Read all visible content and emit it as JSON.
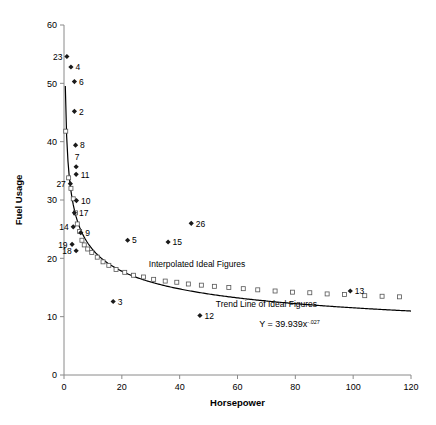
{
  "chart_data": {
    "type": "scatter",
    "title": "",
    "xlabel": "Horsepower",
    "ylabel": "Fuel Usage",
    "xlim": [
      0,
      120
    ],
    "ylim": [
      0,
      60
    ],
    "xticks": [
      0,
      20,
      40,
      60,
      80,
      100,
      120
    ],
    "yticks": [
      0,
      10,
      20,
      30,
      40,
      50,
      60
    ],
    "grid": false,
    "legend_position": "none",
    "series": [
      {
        "name": "Actual Figures",
        "marker": "diamond",
        "points": [
          {
            "label": "23",
            "x": 1.0,
            "y": 54.6
          },
          {
            "label": "4",
            "x": 2.4,
            "y": 52.8
          },
          {
            "label": "6",
            "x": 3.6,
            "y": 50.3
          },
          {
            "label": "2",
            "x": 3.6,
            "y": 45.2
          },
          {
            "label": "8",
            "x": 4.0,
            "y": 39.4
          },
          {
            "label": "7",
            "x": 4.2,
            "y": 35.7
          },
          {
            "label": "11",
            "x": 4.2,
            "y": 34.4
          },
          {
            "label": "27",
            "x": 2.2,
            "y": 32.8
          },
          {
            "label": "10",
            "x": 4.3,
            "y": 29.9
          },
          {
            "label": "17",
            "x": 3.6,
            "y": 27.8
          },
          {
            "label": "14",
            "x": 3.2,
            "y": 25.4
          },
          {
            "label": "9",
            "x": 5.8,
            "y": 24.4
          },
          {
            "label": "19",
            "x": 2.8,
            "y": 22.4
          },
          {
            "label": "18",
            "x": 4.2,
            "y": 21.3
          },
          {
            "label": "5",
            "x": 22.0,
            "y": 23.1
          },
          {
            "label": "15",
            "x": 36.0,
            "y": 22.8
          },
          {
            "label": "26",
            "x": 44.0,
            "y": 26.0
          },
          {
            "label": "3",
            "x": 17.0,
            "y": 12.6
          },
          {
            "label": "12",
            "x": 47.0,
            "y": 10.2
          },
          {
            "label": "13",
            "x": 99.0,
            "y": 14.4
          }
        ]
      },
      {
        "name": "Interpolated Ideal Figures",
        "marker": "square",
        "points": [
          {
            "x": 0.6,
            "y": 41.8
          },
          {
            "x": 1.6,
            "y": 33.8
          },
          {
            "x": 2.4,
            "y": 32.0
          },
          {
            "x": 3.2,
            "y": 30.2
          },
          {
            "x": 4.0,
            "y": 27.8
          },
          {
            "x": 4.6,
            "y": 25.9
          },
          {
            "x": 5.4,
            "y": 24.6
          },
          {
            "x": 6.2,
            "y": 23.1
          },
          {
            "x": 7.0,
            "y": 22.3
          },
          {
            "x": 8.2,
            "y": 21.6
          },
          {
            "x": 9.6,
            "y": 21.0
          },
          {
            "x": 11.5,
            "y": 20.2
          },
          {
            "x": 13.5,
            "y": 19.4
          },
          {
            "x": 15.5,
            "y": 18.8
          },
          {
            "x": 18.0,
            "y": 18.1
          },
          {
            "x": 21.0,
            "y": 17.6
          },
          {
            "x": 24.0,
            "y": 17.1
          },
          {
            "x": 27.5,
            "y": 16.8
          },
          {
            "x": 31.0,
            "y": 16.4
          },
          {
            "x": 35.0,
            "y": 16.1
          },
          {
            "x": 39.0,
            "y": 15.9
          },
          {
            "x": 43.0,
            "y": 15.6
          },
          {
            "x": 47.5,
            "y": 15.4
          },
          {
            "x": 52.0,
            "y": 15.2
          },
          {
            "x": 57.0,
            "y": 15.0
          },
          {
            "x": 62.0,
            "y": 14.8
          },
          {
            "x": 67.0,
            "y": 14.6
          },
          {
            "x": 73.0,
            "y": 14.4
          },
          {
            "x": 79.0,
            "y": 14.2
          },
          {
            "x": 85.0,
            "y": 14.1
          },
          {
            "x": 91.0,
            "y": 13.9
          },
          {
            "x": 97.0,
            "y": 13.8
          },
          {
            "x": 104.0,
            "y": 13.6
          },
          {
            "x": 110.0,
            "y": 13.5
          },
          {
            "x": 116.0,
            "y": 13.4
          }
        ]
      },
      {
        "name": "Trend Line of Ideal Figures",
        "marker": "line",
        "fit": "power",
        "coefficient": 39.939,
        "exponent": -0.27
      }
    ],
    "annotations": [
      {
        "name": "interpolated-label",
        "text": "Interpolated Ideal Figures",
        "x": 46,
        "y": 18.6
      },
      {
        "name": "trendline-label",
        "text": "Trend Line of Ideal Figures",
        "x": 70,
        "y": 11.6
      },
      {
        "name": "equation",
        "text": "Y = 39.939x",
        "superscript": "-.027",
        "x": 78,
        "y": 8.2
      }
    ]
  },
  "axes": {
    "x_label": "Horsepower",
    "y_label": "Fuel Usage",
    "x_ticks": [
      "0",
      "20",
      "40",
      "60",
      "80",
      "100",
      "120"
    ],
    "y_ticks": [
      "0",
      "10",
      "20",
      "30",
      "40",
      "50",
      "60"
    ]
  },
  "colors": {
    "axis": "#8a8a8a",
    "marker": "#1a1a1a",
    "trendline": "#000000",
    "interp_marker_fill": "#ffffff",
    "interp_marker_stroke": "#555555",
    "background": "#ffffff"
  }
}
